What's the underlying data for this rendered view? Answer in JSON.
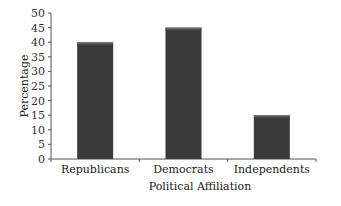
{
  "chart_data": {
    "type": "bar",
    "title": "",
    "xlabel": "Political Affiliation",
    "ylabel": "Percentage",
    "categories": [
      "Republicans",
      "Democrats",
      "Independents"
    ],
    "values": [
      40,
      45,
      15
    ],
    "ylim": [
      0,
      50
    ],
    "yticks": [
      0,
      5,
      10,
      15,
      20,
      25,
      30,
      35,
      40,
      45,
      50
    ],
    "grid": false,
    "legend": null,
    "bar_color": "#3a3a3a"
  }
}
